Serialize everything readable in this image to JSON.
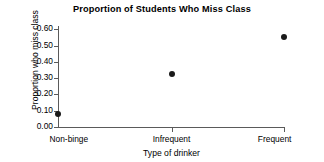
{
  "chart_data": {
    "type": "scatter",
    "title": "Proportion of Students Who Miss Class",
    "xlabel": "Type of drinker",
    "ylabel": "Proportion who miss class",
    "categories": [
      "Non-binge",
      "Infrequent",
      "Frequent"
    ],
    "values": [
      0.08,
      0.325,
      0.555
    ],
    "series": [
      {
        "name": "Proportion who miss class",
        "values": [
          0.08,
          0.325,
          0.555
        ]
      }
    ],
    "ylim": [
      0.0,
      0.62
    ],
    "yticks": [
      0.0,
      0.1,
      0.2,
      0.3,
      0.4,
      0.5,
      0.6
    ],
    "ytick_labels": [
      "0.00",
      "0.10",
      "0.20",
      "0.30",
      "0.40",
      "0.50",
      "0.60"
    ],
    "xtick_labels": [
      "Non-binge",
      "Infrequent",
      "Frequent"
    ],
    "grid": false,
    "legend": null,
    "marker": "filled-circle",
    "marker_color": "#1a1a1a",
    "axis_color": "#5a5a5a",
    "background_color": "#ffffff"
  }
}
